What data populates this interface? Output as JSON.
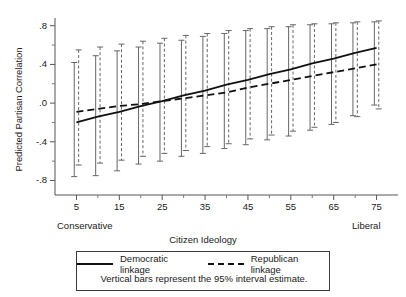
{
  "chart_data": {
    "type": "line",
    "title": "",
    "xlabel": "Citizen Ideology",
    "ylabel": "Predicted Partisan Correlation",
    "xlim": [
      0,
      80
    ],
    "ylim": [
      -0.95,
      0.88
    ],
    "grid": false,
    "x_tick_labels": [
      "5",
      "15",
      "25",
      "35",
      "45",
      "55",
      "65",
      "75"
    ],
    "x_tick_values": [
      5,
      15,
      25,
      35,
      45,
      55,
      65,
      75
    ],
    "x_minor_ticks": [
      10,
      20,
      30,
      40,
      50,
      60,
      70
    ],
    "y_tick_labels": [
      ".8",
      ".4",
      ".0",
      "-.4",
      "-.8"
    ],
    "y_tick_values": [
      0.8,
      0.4,
      0.0,
      -0.4,
      -0.8
    ],
    "y_minor_ticks": [
      0.6,
      0.2,
      -0.2,
      -0.6
    ],
    "axis_end_labels": {
      "left": "Conservative",
      "right": "Liberal"
    },
    "x": [
      5,
      10,
      15,
      20,
      25,
      30,
      35,
      40,
      45,
      50,
      55,
      60,
      65,
      70,
      75
    ],
    "series": [
      {
        "name": "Democratic linkage",
        "style": "solid",
        "color": "#111111",
        "values": [
          -0.2,
          -0.14,
          -0.09,
          -0.03,
          0.02,
          0.08,
          0.13,
          0.19,
          0.24,
          0.3,
          0.35,
          0.41,
          0.46,
          0.52,
          0.57
        ],
        "ci_lower": [
          -0.76,
          -0.75,
          -0.7,
          -0.63,
          -0.6,
          -0.55,
          -0.52,
          -0.47,
          -0.43,
          -0.38,
          -0.34,
          -0.28,
          -0.22,
          -0.13,
          -0.02
        ],
        "ci_upper": [
          0.42,
          0.49,
          0.54,
          0.58,
          0.62,
          0.65,
          0.69,
          0.72,
          0.75,
          0.77,
          0.79,
          0.81,
          0.82,
          0.83,
          0.84
        ]
      },
      {
        "name": "Republican linkage",
        "style": "dashed",
        "color": "#111111",
        "values": [
          -0.09,
          -0.06,
          -0.03,
          -0.01,
          0.02,
          0.05,
          0.08,
          0.11,
          0.16,
          0.2,
          0.24,
          0.28,
          0.32,
          0.36,
          0.4
        ],
        "ci_lower": [
          -0.64,
          -0.62,
          -0.59,
          -0.55,
          -0.52,
          -0.49,
          -0.45,
          -0.42,
          -0.37,
          -0.33,
          -0.29,
          -0.25,
          -0.2,
          -0.14,
          -0.06
        ],
        "ci_upper": [
          0.55,
          0.58,
          0.61,
          0.64,
          0.67,
          0.7,
          0.72,
          0.75,
          0.77,
          0.79,
          0.81,
          0.82,
          0.83,
          0.84,
          0.85
        ]
      }
    ],
    "legend": {
      "position": "below",
      "entries": [
        {
          "label": "Democratic linkage",
          "style": "solid"
        },
        {
          "label": "Republican linkage",
          "style": "dashed"
        }
      ],
      "note": "Vertical bars represent the 95% interval estimate."
    }
  }
}
